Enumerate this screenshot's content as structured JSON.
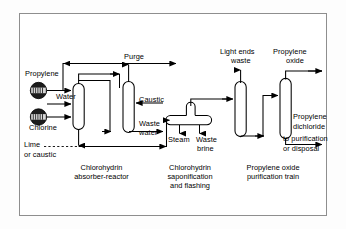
{
  "diagram": {
    "type": "process-flow-diagram",
    "frame": {
      "border_color": "#8e8e8e",
      "background": "#ffffff"
    },
    "line_color": "#000000"
  },
  "feeds": [
    {
      "id": "propylene",
      "label": "Propylene",
      "symbol": "compressor-icon"
    },
    {
      "id": "water",
      "label": "Water"
    },
    {
      "id": "chlorine",
      "label": "Chlorine",
      "symbol": "compressor-icon"
    },
    {
      "id": "lime",
      "label": "Lime\nor caustic"
    }
  ],
  "streams": [
    {
      "id": "purge",
      "label": "Purge"
    },
    {
      "id": "caustic",
      "label": "Caustic"
    },
    {
      "id": "waste-water",
      "label": "Waste\nwater"
    },
    {
      "id": "steam",
      "label": "Steam"
    },
    {
      "id": "waste-brine",
      "label": "Waste\nbrine"
    },
    {
      "id": "light-ends-waste",
      "label": "Light ends\nwaste"
    },
    {
      "id": "propylene-oxide",
      "label": "Propylene\noxide"
    },
    {
      "id": "propylene-dichloride",
      "label": "Propylene\ndichloride"
    },
    {
      "id": "to-purification",
      "label": "to purification\nor disposal"
    }
  ],
  "labels": {
    "propylene": "Propylene",
    "water": "Water",
    "chlorine": "Chlorine",
    "lime_line1": "Lime",
    "lime_line2": "or caustic",
    "purge": "Purge",
    "caustic": "Caustic",
    "waste_water_line1": "Waste",
    "waste_water_line2": "water",
    "steam": "Steam",
    "waste_brine_line1": "Waste",
    "waste_brine_line2": "brine",
    "light_ends_line1": "Light ends",
    "light_ends_line2": "waste",
    "propylene_oxide_line1": "Propylene",
    "propylene_oxide_line2": "oxide",
    "propylene_dichloride_line1": "Propylene",
    "propylene_dichloride_line2": "dichloride",
    "to_purification_line1": "to purification",
    "to_purification_line2": "or disposal"
  },
  "units": [
    {
      "id": "chlorohydrin-absorber-reactor",
      "caption_line1": "Chlorohydrin",
      "caption_line2": "absorber-reactor",
      "caption_line3": "",
      "shape": "vertical-column"
    },
    {
      "id": "chlorohydrin-saponification",
      "caption_line1": "Chlorohydrin",
      "caption_line2": "saponification",
      "caption_line3": "and flashing",
      "shape": "horizontal-drum-with-stack"
    },
    {
      "id": "propylene-oxide-purification-train",
      "caption_line1": "Propylene oxide",
      "caption_line2": "purification train",
      "caption_line3": "",
      "shape": "two-vertical-columns"
    }
  ],
  "captions": {
    "unit1_l1": "Chlorohydrin",
    "unit1_l2": "absorber-reactor",
    "unit2_l1": "Chlorohydrin",
    "unit2_l2": "saponification",
    "unit2_l3": "and flashing",
    "unit3_l1": "Propylene oxide",
    "unit3_l2": "purification train"
  }
}
